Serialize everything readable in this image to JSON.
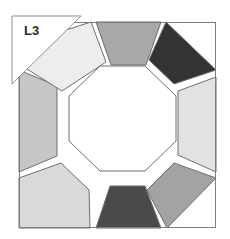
{
  "figure": {
    "title": "L3",
    "kind": "quilt-block-diagram",
    "background_color": "#ffffff"
  },
  "label_tab": {
    "text": "L3",
    "shape": "right-triangle",
    "stroke_color": "#8f8f8f",
    "fill_color": "#ffffff",
    "text_color": "#2b2b2b"
  },
  "block_frame": {
    "stroke_color": "#7d7d7d",
    "fill_color": "#ffffff",
    "x": 19,
    "y": 22,
    "width": 197,
    "height": 206
  },
  "center": {
    "name": "center-octagon",
    "fill_color": "#ffffff",
    "stroke_color": "#6e6e6e"
  },
  "outline_color": "#6e6e6e",
  "segments": [
    {
      "position": "top",
      "fill_color": "#a8a8a8",
      "shade": "medium gray"
    },
    {
      "position": "top-right",
      "fill_color": "#333333",
      "shade": "near black"
    },
    {
      "position": "right",
      "fill_color": "#e2e2e2",
      "shade": "light gray"
    },
    {
      "position": "bottom-right",
      "fill_color": "#a3a3a3",
      "shade": "medium gray"
    },
    {
      "position": "bottom",
      "fill_color": "#4a4a4a",
      "shade": "dark gray"
    },
    {
      "position": "bottom-left",
      "fill_color": "#d9d9d9",
      "shade": "light gray"
    },
    {
      "position": "left",
      "fill_color": "#c6c6c6",
      "shade": "medium light gray"
    },
    {
      "position": "top-left",
      "fill_color": "#ededed",
      "shade": "off white"
    }
  ],
  "corners": {
    "fill_color": "#ffffff",
    "count": 4
  }
}
